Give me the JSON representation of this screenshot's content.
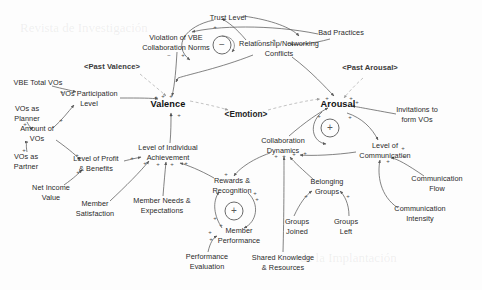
{
  "diagram": {
    "type": "causal-loop-diagram",
    "colors": {
      "link": "#555555",
      "text": "#2a2a2a",
      "background": "#fdfdfd"
    },
    "nodes": [
      {
        "id": "trust_level",
        "label": "Trust Level",
        "x": 228,
        "y": 18,
        "style": "plain"
      },
      {
        "id": "bad_practices",
        "label": "Bad Practices",
        "x": 341,
        "y": 33,
        "style": "plain"
      },
      {
        "id": "violation_norms",
        "label": "Violation of VBE\nCollaboration Norms",
        "x": 176,
        "y": 42,
        "style": "plain"
      },
      {
        "id": "relationship_conflicts",
        "label": "Relationship/Networking\nConflicts",
        "x": 279,
        "y": 48,
        "style": "plain"
      },
      {
        "id": "past_valence",
        "label": "<Past Valence>",
        "x": 112,
        "y": 67,
        "style": "ghost"
      },
      {
        "id": "past_arousal",
        "label": "<Past Arousal>",
        "x": 370,
        "y": 68,
        "style": "ghost"
      },
      {
        "id": "vbe_total_vos",
        "label": "VBE Total VOs",
        "x": 38,
        "y": 83,
        "style": "plain"
      },
      {
        "id": "vos_participation",
        "label": "VOs Participation\nLevel",
        "x": 89,
        "y": 98,
        "style": "plain"
      },
      {
        "id": "valence",
        "label": "Valence",
        "x": 168,
        "y": 105,
        "style": "emph"
      },
      {
        "id": "arousal",
        "label": "Arousal",
        "x": 338,
        "y": 105,
        "style": "emph"
      },
      {
        "id": "vos_as_planner",
        "label": "VOs as\nPlanner",
        "x": 27,
        "y": 113,
        "style": "plain"
      },
      {
        "id": "invitations_form_vos",
        "label": "Invitations to\nform VOs",
        "x": 417,
        "y": 114,
        "style": "plain"
      },
      {
        "id": "emotion",
        "label": "<Emotion>",
        "x": 246,
        "y": 115,
        "style": "center"
      },
      {
        "id": "amount_of_vos",
        "label": "Amount of\nVOs",
        "x": 37,
        "y": 133,
        "style": "plain"
      },
      {
        "id": "collaboration_dynamics",
        "label": "Collaboration\nDynamics",
        "x": 283,
        "y": 145,
        "style": "plain"
      },
      {
        "id": "level_individual_achievement",
        "label": "Level of Individual\nAchievement",
        "x": 168,
        "y": 152,
        "style": "plain"
      },
      {
        "id": "level_of_communication",
        "label": "Level of\nCommunication",
        "x": 385,
        "y": 150,
        "style": "plain"
      },
      {
        "id": "vos_as_partner",
        "label": "VOs as\nPartner",
        "x": 26,
        "y": 161,
        "style": "plain"
      },
      {
        "id": "level_profit_benefits",
        "label": "Level of Profit\n& Benefits",
        "x": 96,
        "y": 163,
        "style": "plain"
      },
      {
        "id": "rewards_recognition",
        "label": "Rewards &\nRecognition",
        "x": 232,
        "y": 185,
        "style": "plain"
      },
      {
        "id": "belonging_groups",
        "label": "Belonging\nGroups",
        "x": 327,
        "y": 186,
        "style": "plain"
      },
      {
        "id": "communication_flow",
        "label": "Communication\nFlow",
        "x": 437,
        "y": 183,
        "style": "plain"
      },
      {
        "id": "net_income_value",
        "label": "Net Income\nValue",
        "x": 51,
        "y": 192,
        "style": "plain"
      },
      {
        "id": "member_needs",
        "label": "Member Needs &\nExpectations",
        "x": 162,
        "y": 205,
        "style": "plain"
      },
      {
        "id": "member_satisfaction",
        "label": "Member\nSatisfaction",
        "x": 95,
        "y": 208,
        "style": "plain"
      },
      {
        "id": "communication_intensity",
        "label": "Communication\nIntensity",
        "x": 420,
        "y": 213,
        "style": "plain"
      },
      {
        "id": "groups_joined",
        "label": "Groups\nJoined",
        "x": 297,
        "y": 226,
        "style": "plain"
      },
      {
        "id": "groups_left",
        "label": "Groups\nLeft",
        "x": 346,
        "y": 226,
        "style": "plain"
      },
      {
        "id": "member_performance",
        "label": "Member\nPerformance",
        "x": 239,
        "y": 235,
        "style": "plain"
      },
      {
        "id": "performance_evaluation",
        "label": "Performance\nEvaluation",
        "x": 207,
        "y": 261,
        "style": "plain"
      },
      {
        "id": "shared_knowledge",
        "label": "Shared Knowledge\n& Resources",
        "x": 283,
        "y": 262,
        "style": "plain"
      }
    ],
    "loop_markers": [
      {
        "id": "balancing-loop-conflicts",
        "polarity": "−",
        "x": 222,
        "y": 45
      },
      {
        "id": "reinforcing-loop-arousal",
        "polarity": "+",
        "x": 330,
        "y": 128
      },
      {
        "id": "reinforcing-loop-rewards",
        "polarity": "+",
        "x": 234,
        "y": 211
      }
    ],
    "edge_signs": [
      {
        "sign": "+",
        "x": 215,
        "y": 27
      },
      {
        "sign": "−",
        "x": 259,
        "y": 40
      },
      {
        "sign": "+",
        "x": 274,
        "y": 40
      },
      {
        "sign": "−",
        "x": 169,
        "y": 55
      },
      {
        "sign": "+",
        "x": 183,
        "y": 55
      },
      {
        "sign": "+",
        "x": 62,
        "y": 92
      },
      {
        "sign": "+",
        "x": 156,
        "y": 97
      },
      {
        "sign": "+",
        "x": 163,
        "y": 96
      },
      {
        "sign": "+",
        "x": 171,
        "y": 96
      },
      {
        "sign": "+",
        "x": 351,
        "y": 98
      },
      {
        "sign": "+",
        "x": 357,
        "y": 102
      },
      {
        "sign": "+",
        "x": 327,
        "y": 98
      },
      {
        "sign": "+",
        "x": 25,
        "y": 124
      },
      {
        "sign": "+",
        "x": 61,
        "y": 120
      },
      {
        "sign": "+",
        "x": 171,
        "y": 115
      },
      {
        "sign": "+",
        "x": 179,
        "y": 115
      },
      {
        "sign": "+",
        "x": 350,
        "y": 117
      },
      {
        "sign": "+",
        "x": 319,
        "y": 116
      },
      {
        "sign": "+",
        "x": 24,
        "y": 150
      },
      {
        "sign": "+",
        "x": 77,
        "y": 155
      },
      {
        "sign": "+",
        "x": 132,
        "y": 158
      },
      {
        "sign": "+",
        "x": 78,
        "y": 172
      },
      {
        "sign": "+",
        "x": 145,
        "y": 163
      },
      {
        "sign": "+",
        "x": 158,
        "y": 164
      },
      {
        "sign": "+",
        "x": 172,
        "y": 164
      },
      {
        "sign": "+",
        "x": 186,
        "y": 163
      },
      {
        "sign": "+",
        "x": 276,
        "y": 156
      },
      {
        "sign": "+",
        "x": 284,
        "y": 156
      },
      {
        "sign": "+",
        "x": 294,
        "y": 154
      },
      {
        "sign": "+",
        "x": 305,
        "y": 153
      },
      {
        "sign": "+",
        "x": 388,
        "y": 161
      },
      {
        "sign": "+",
        "x": 403,
        "y": 148
      },
      {
        "sign": "+",
        "x": 404,
        "y": 156
      },
      {
        "sign": "+",
        "x": 226,
        "y": 174
      },
      {
        "sign": "+",
        "x": 255,
        "y": 193
      },
      {
        "sign": "+",
        "x": 257,
        "y": 199
      },
      {
        "sign": "+",
        "x": 306,
        "y": 196
      },
      {
        "sign": "+",
        "x": 348,
        "y": 196
      },
      {
        "sign": "+",
        "x": 215,
        "y": 218
      },
      {
        "sign": "+",
        "x": 221,
        "y": 225
      },
      {
        "sign": "+",
        "x": 210,
        "y": 232
      },
      {
        "sign": "+",
        "x": 211,
        "y": 239
      }
    ]
  }
}
